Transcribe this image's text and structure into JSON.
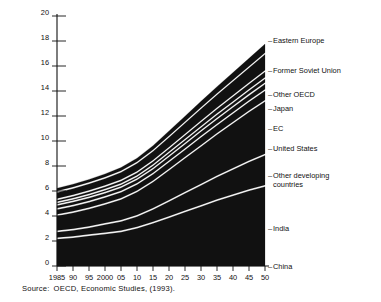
{
  "source": {
    "label": "Source:",
    "text": "OECD, Economic Studies, (1993)."
  },
  "legend": {
    "dash": "–",
    "items": [
      {
        "label": "Eastern Europe"
      },
      {
        "label": "Former Soviet Union"
      },
      {
        "label": "Other OECD"
      },
      {
        "label": "Japan"
      },
      {
        "label": "EC"
      },
      {
        "label": "United States"
      },
      {
        "label": "Other developing countries"
      },
      {
        "label": "India"
      },
      {
        "label": "China"
      }
    ]
  },
  "axes": {
    "y_ticks": [
      "0",
      "2",
      "4",
      "6",
      "8",
      "10",
      "12",
      "14",
      "16",
      "18",
      "20"
    ],
    "x_ticks": [
      "1985",
      "90",
      "95",
      "2000",
      "05",
      "10",
      "15",
      "20",
      "25",
      "30",
      "35",
      "40",
      "45",
      "50"
    ]
  },
  "colors": {
    "band": "#111111",
    "gap": "#ffffff",
    "axis": "#111111",
    "background": "#ffffff"
  },
  "chart_data": {
    "type": "area",
    "title": "",
    "subtitle": "",
    "xlabel": "",
    "ylabel": "",
    "stacked": true,
    "grid": false,
    "legend_position": "right",
    "xlim": [
      1985,
      2050
    ],
    "ylim": [
      0,
      20
    ],
    "x": [
      1985,
      1990,
      1995,
      2000,
      2005,
      2010,
      2015,
      2020,
      2025,
      2030,
      2035,
      2040,
      2045,
      2050
    ],
    "series": [
      {
        "name": "China",
        "values": [
          2.15,
          2.25,
          2.4,
          2.55,
          2.7,
          3.0,
          3.4,
          3.85,
          4.3,
          4.75,
          5.2,
          5.6,
          6.0,
          6.35
        ]
      },
      {
        "name": "India",
        "values": [
          0.55,
          0.6,
          0.65,
          0.75,
          0.85,
          0.95,
          1.1,
          1.3,
          1.5,
          1.7,
          1.9,
          2.1,
          2.3,
          2.5
        ]
      },
      {
        "name": "Other developing countries",
        "values": [
          1.3,
          1.4,
          1.5,
          1.6,
          1.75,
          1.95,
          2.2,
          2.5,
          2.8,
          3.1,
          3.4,
          3.7,
          4.0,
          4.3
        ]
      },
      {
        "name": "United States",
        "values": [
          0.5,
          0.52,
          0.54,
          0.56,
          0.58,
          0.6,
          0.63,
          0.66,
          0.69,
          0.72,
          0.75,
          0.78,
          0.81,
          0.85
        ]
      },
      {
        "name": "EC",
        "values": [
          0.32,
          0.33,
          0.34,
          0.35,
          0.36,
          0.38,
          0.4,
          0.42,
          0.44,
          0.46,
          0.48,
          0.5,
          0.52,
          0.55
        ]
      },
      {
        "name": "Japan",
        "values": [
          0.2,
          0.21,
          0.22,
          0.23,
          0.24,
          0.25,
          0.27,
          0.29,
          0.31,
          0.33,
          0.35,
          0.37,
          0.39,
          0.42
        ]
      },
      {
        "name": "Other OECD",
        "values": [
          0.25,
          0.26,
          0.27,
          0.28,
          0.3,
          0.32,
          0.34,
          0.37,
          0.4,
          0.43,
          0.46,
          0.49,
          0.52,
          0.56
        ]
      },
      {
        "name": "Former Soviet Union",
        "values": [
          0.6,
          0.62,
          0.64,
          0.67,
          0.7,
          0.75,
          0.82,
          0.9,
          0.98,
          1.06,
          1.14,
          1.22,
          1.3,
          1.4
        ]
      },
      {
        "name": "Eastern Europe",
        "values": [
          0.35,
          0.36,
          0.37,
          0.38,
          0.4,
          0.43,
          0.47,
          0.52,
          0.57,
          0.62,
          0.67,
          0.72,
          0.77,
          0.83
        ]
      }
    ],
    "totals": [
      6.22,
      6.55,
      6.93,
      7.37,
      7.88,
      8.63,
      9.63,
      10.81,
      11.99,
      13.17,
      14.35,
      15.48,
      16.61,
      17.76
    ]
  }
}
